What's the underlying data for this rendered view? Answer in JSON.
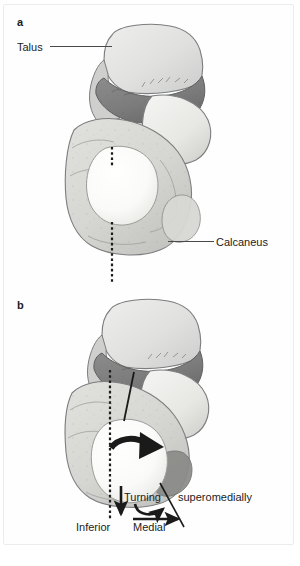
{
  "figure": {
    "panels": [
      {
        "letter": "a",
        "caption": ""
      },
      {
        "letter": "b",
        "caption": ""
      }
    ]
  },
  "labels": {
    "talus": "Talus",
    "calcaneus": "Calcaneus",
    "turning": "Turning",
    "superomedially": "superomedially",
    "inferior": "Inferior",
    "medial": "Medial"
  },
  "panel_letters": {
    "a": "a",
    "b": "b"
  },
  "bottom_caption": "",
  "colors": {
    "background": "#ffffff",
    "frame_border": "#ececed",
    "bone_light": "#e3e3e2",
    "bone_midlight": "#d2d3d2",
    "bone_shadow": "#bcbdbc",
    "cartilage_white": "#fbfbfa",
    "articular_dark": "#848484",
    "articular_darker": "#6f6f6f",
    "outline": "#6e6f70",
    "text": "#1d1d1d",
    "leader_line": "#4a4a4a",
    "arrow_black": "#1a1a1a",
    "dotted_axis": "#1c1c1c"
  },
  "annotations": {
    "axis_line_style": "dotted-vertical",
    "rotation_arrow": "curved-arrow-pointing-right",
    "inferior_arrow": "straight-arrow-down",
    "medial_arrow": "straight-arrow-right",
    "turning_arrow": "curved-arrow-up-right",
    "superomedially_pointer": "diagonal-line"
  },
  "icons": {
    "panel_a_axis": "dotted-axis-icon",
    "panel_b_axis": "dotted-axis-icon",
    "rotation": "curved-arrow-icon",
    "down": "arrow-down-icon",
    "right": "arrow-right-icon",
    "turn": "curved-turn-arrow-icon"
  }
}
